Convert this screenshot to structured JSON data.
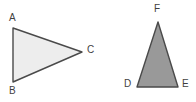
{
  "figure": {
    "background_color": "#ffffff",
    "stroke_color": "#4a4a4a",
    "label_color": "#3f3f3f",
    "shapes": [
      {
        "name": "triangle-abc",
        "kind": "triangle",
        "fill_color": "#ededed",
        "stroke_color": "#4a4a4a",
        "stroke_width": 1.4,
        "points": "13,28 13,82 82,52",
        "vertices": [
          {
            "label": "A",
            "x": 13,
            "y": 28
          },
          {
            "label": "B",
            "x": 13,
            "y": 82
          },
          {
            "label": "C",
            "x": 82,
            "y": 52
          }
        ]
      },
      {
        "name": "triangle-def",
        "kind": "triangle",
        "fill_color": "#999999",
        "stroke_color": "#4a4a4a",
        "stroke_width": 1.4,
        "points": "158,22 178,87 137,87",
        "vertices": [
          {
            "label": "F",
            "x": 158,
            "y": 22
          },
          {
            "label": "D",
            "x": 137,
            "y": 87
          },
          {
            "label": "E",
            "x": 178,
            "y": 87
          }
        ]
      }
    ]
  }
}
